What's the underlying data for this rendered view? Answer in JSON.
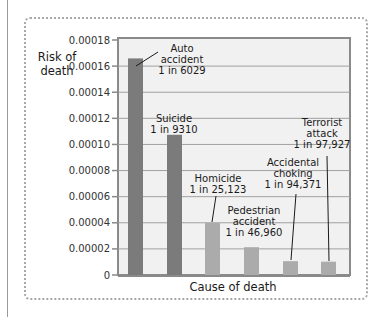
{
  "chart_data": {
    "type": "bar",
    "title": "",
    "xlabel": "Cause of death",
    "ylabel": "Risk of death",
    "ylabel_lines": [
      "Risk of",
      "death"
    ],
    "ylim": [
      0,
      0.00018
    ],
    "yticks": [
      "0",
      "0.00002",
      "0.00004",
      "0.00006",
      "0.00008",
      "0.00010",
      "0.00012",
      "0.00014",
      "0.00016",
      "0.00018"
    ],
    "grid": true,
    "legend": null,
    "categories": [
      "Auto accident",
      "Suicide",
      "Homicide",
      "Pedestrian accident",
      "Accidental choking",
      "Terrorist attack"
    ],
    "values": [
      0.0001659,
      0.0001074,
      3.98e-05,
      2.13e-05,
      1.06e-05,
      1.02e-05
    ],
    "annotations": [
      {
        "lines": [
          "Auto",
          "accident",
          "1 in 6029"
        ]
      },
      {
        "lines": [
          "Suicide",
          "1 in 9310"
        ]
      },
      {
        "lines": [
          "Homicide",
          "1 in 25,123"
        ]
      },
      {
        "lines": [
          "Pedestrian",
          "accident",
          "1 in 46,960"
        ]
      },
      {
        "lines": [
          "Accidental",
          "choking",
          "1 in 94,371"
        ]
      },
      {
        "lines": [
          "Terrorist",
          "attack",
          "1 in 97,927"
        ]
      }
    ],
    "colors": {
      "dark_bar": "#7b7b7b",
      "light_bar": "#ababab",
      "plot_bg": "#f1f1f1",
      "grid": "#a0a0a0",
      "plot_border": "#8a8a8a"
    }
  }
}
